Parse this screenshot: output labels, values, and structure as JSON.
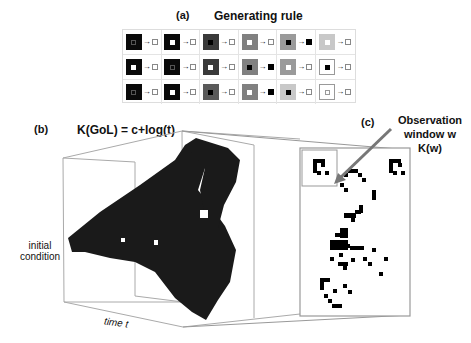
{
  "panel_a": {
    "label": "(a)",
    "title": "Generating rule",
    "rows": [
      [
        {
          "outer": "#0a0a0a",
          "inner": "#0a0a0a",
          "inner_border": "#555",
          "result": "white"
        },
        {
          "outer": "#0a0a0a",
          "inner": "#ffffff",
          "inner_border": "#fff",
          "result": "white"
        },
        {
          "outer": "#3a3a3a",
          "inner": "#000000",
          "inner_border": "#000",
          "result": "white"
        },
        {
          "outer": "#808080",
          "inner": "#ffffff",
          "inner_border": "#fff",
          "result": "white"
        },
        {
          "outer": "#9a9a9a",
          "inner": "#000000",
          "inner_border": "#000",
          "result": "black"
        },
        {
          "outer": "#c8c8c8",
          "inner": "#ffffff",
          "inner_border": "#fff",
          "result": "white"
        }
      ],
      [
        {
          "outer": "#0a0a0a",
          "inner": "#ffffff",
          "inner_border": "#fff",
          "result": "white"
        },
        {
          "outer": "#0a0a0a",
          "inner": "#0a0a0a",
          "inner_border": "#555",
          "result": "white"
        },
        {
          "outer": "#3a3a3a",
          "inner": "#ffffff",
          "inner_border": "#fff",
          "result": "white"
        },
        {
          "outer": "#808080",
          "inner": "#000000",
          "inner_border": "#000",
          "result": "black"
        },
        {
          "outer": "#9a9a9a",
          "inner": "#ffffff",
          "inner_border": "#fff",
          "result": "white"
        },
        {
          "outer": "#ffffff",
          "inner": "#000000",
          "inner_border": "#000",
          "result": "white"
        }
      ],
      [
        {
          "outer": "#0a0a0a",
          "inner": "#0a0a0a",
          "inner_border": "#555",
          "result": "white"
        },
        {
          "outer": "#0a0a0a",
          "inner": "#ffffff",
          "inner_border": "#fff",
          "result": "white"
        },
        {
          "outer": "#5a5a5a",
          "inner": "#000000",
          "inner_border": "#000",
          "result": "white"
        },
        {
          "outer": "#808080",
          "inner": "#ffffff",
          "inner_border": "#fff",
          "result": "black"
        },
        {
          "outer": "#c8c8c8",
          "inner": "#000000",
          "inner_border": "#000",
          "result": "white"
        },
        {
          "outer": "#ffffff",
          "inner": "#ffffff",
          "inner_border": "#999",
          "result": "white"
        }
      ]
    ],
    "arrow": "→"
  },
  "panel_b": {
    "label": "(b)",
    "title": "K(GoL) = c+log(t)",
    "y_axis_label_line1": "initial",
    "y_axis_label_line2": "condition",
    "x_axis_label": "time t"
  },
  "panel_c": {
    "label": "(c)",
    "annotation_line1": "Observation",
    "annotation_line2": "window w",
    "annotation_line3": "K(w)"
  },
  "colors": {
    "cube": "#1a1a1a",
    "box_line": "#999999",
    "arrow": "#777777"
  }
}
